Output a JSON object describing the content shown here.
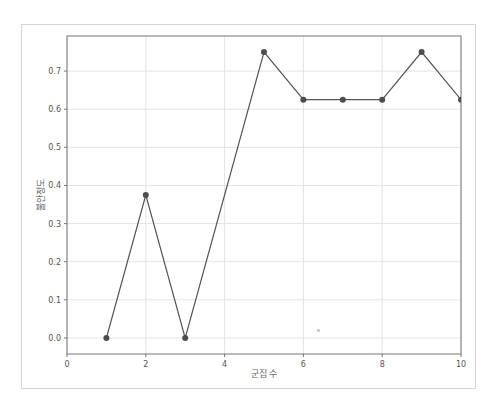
{
  "chart_data": {
    "type": "line",
    "title": "",
    "xlabel": "군집 수",
    "ylabel": "불안정도",
    "x": [
      1,
      2,
      3,
      4,
      5,
      6,
      7,
      8,
      9,
      10
    ],
    "series": [
      {
        "name": "불안정도",
        "values": [
          0.0,
          0.375,
          0.0,
          null,
          0.75,
          0.625,
          0.625,
          0.625,
          0.75,
          0.625
        ],
        "points": [
          [
            1,
            0.0
          ],
          [
            2,
            0.375
          ],
          [
            3,
            0.0
          ],
          [
            5,
            0.75
          ],
          [
            6,
            0.625
          ],
          [
            7,
            0.625
          ],
          [
            8,
            0.625
          ],
          [
            9,
            0.75
          ],
          [
            10,
            0.625
          ]
        ],
        "color": "#555555",
        "marker": "circle"
      }
    ],
    "xlim": [
      0,
      10
    ],
    "ylim": [
      -0.042,
      0.792
    ],
    "xticks": [
      "0",
      "2",
      "4",
      "6",
      "8",
      "10"
    ],
    "yticks": [
      "0.0",
      "0.1",
      "0.2",
      "0.3",
      "0.4",
      "0.5",
      "0.6",
      "0.7"
    ],
    "grid": true,
    "legend": null
  },
  "colors": {
    "line": "#555555",
    "marker": "#4d4d4d",
    "grid": "#e4e4e4",
    "axes": "#777777",
    "frame": "#d6d6d6"
  }
}
